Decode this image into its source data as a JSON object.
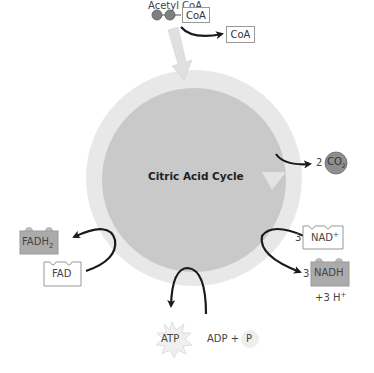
{
  "diagram": {
    "title": "Citric Acid Cycle",
    "input": {
      "label": "Acetyl CoA",
      "carrier": "CoA",
      "released": "CoA"
    },
    "outputs": {
      "co2": {
        "count": "2",
        "label": "CO",
        "subscript": "2"
      },
      "nad": {
        "count": "3",
        "label": "NAD",
        "superscript": "+"
      },
      "nadh": {
        "count": "3",
        "label": "NADH",
        "extra": "+3 H",
        "extra_sup": "+"
      },
      "fad": {
        "label": "FAD"
      },
      "fadh2": {
        "label": "FADH",
        "subscript": "2"
      },
      "atp": {
        "label": "ATP"
      },
      "adp": {
        "label": "ADP +",
        "phosphate": "P"
      }
    },
    "colors": {
      "ring": "#e6e6e6",
      "core": "#c8c8c8",
      "dark_box": "#a8a8a8",
      "co2": "#8e8e8e",
      "arrow": "#1a1a1a"
    }
  }
}
